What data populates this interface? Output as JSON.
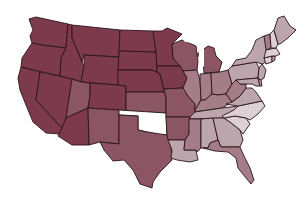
{
  "map": {
    "type": "choropleth",
    "region": "United States (contiguous)",
    "legend": null,
    "scale": {
      "level1": "#7d3a4d",
      "level2": "#8c5564",
      "level3": "#a47d88",
      "level4": "#bca6ad",
      "level5": "#ddd0d4",
      "nodata": "#ffffff"
    },
    "states": [
      {
        "id": "WA",
        "level": "level1"
      },
      {
        "id": "OR",
        "level": "level1"
      },
      {
        "id": "CA",
        "level": "level1"
      },
      {
        "id": "NV",
        "level": "level1"
      },
      {
        "id": "ID",
        "level": "level1"
      },
      {
        "id": "MT",
        "level": "level1"
      },
      {
        "id": "WY",
        "level": "level1"
      },
      {
        "id": "UT",
        "level": "level2"
      },
      {
        "id": "AZ",
        "level": "level1"
      },
      {
        "id": "CO",
        "level": "level1"
      },
      {
        "id": "NM",
        "level": "level2"
      },
      {
        "id": "ND",
        "level": "level1"
      },
      {
        "id": "SD",
        "level": "level1"
      },
      {
        "id": "NE",
        "level": "level1"
      },
      {
        "id": "KS",
        "level": "level2"
      },
      {
        "id": "OK",
        "level": "nodata"
      },
      {
        "id": "TX",
        "level": "level2"
      },
      {
        "id": "MN",
        "level": "level1"
      },
      {
        "id": "IA",
        "level": "level1"
      },
      {
        "id": "MO",
        "level": "level2"
      },
      {
        "id": "AR",
        "level": "level2"
      },
      {
        "id": "LA",
        "level": "level4"
      },
      {
        "id": "WI",
        "level": "level2"
      },
      {
        "id": "IL",
        "level": "level3"
      },
      {
        "id": "MI",
        "level": "level2"
      },
      {
        "id": "IN",
        "level": "level3"
      },
      {
        "id": "OH",
        "level": "level3"
      },
      {
        "id": "KY",
        "level": "level3"
      },
      {
        "id": "TN",
        "level": "level4"
      },
      {
        "id": "MS",
        "level": "level3"
      },
      {
        "id": "AL",
        "level": "level4"
      },
      {
        "id": "GA",
        "level": "level4"
      },
      {
        "id": "FL",
        "level": "level3"
      },
      {
        "id": "SC",
        "level": "level5"
      },
      {
        "id": "NC",
        "level": "level5"
      },
      {
        "id": "VA",
        "level": "level4"
      },
      {
        "id": "WV",
        "level": "level3"
      },
      {
        "id": "PA",
        "level": "level4"
      },
      {
        "id": "NY",
        "level": "level4"
      },
      {
        "id": "VT",
        "level": "level3"
      },
      {
        "id": "NH",
        "level": "level5"
      },
      {
        "id": "ME",
        "level": "level4"
      },
      {
        "id": "MA",
        "level": "level5"
      },
      {
        "id": "CT",
        "level": "level5"
      },
      {
        "id": "RI",
        "level": "level4"
      },
      {
        "id": "NJ",
        "level": "level4"
      },
      {
        "id": "DE",
        "level": "level4"
      },
      {
        "id": "MD",
        "level": "level4"
      }
    ]
  }
}
